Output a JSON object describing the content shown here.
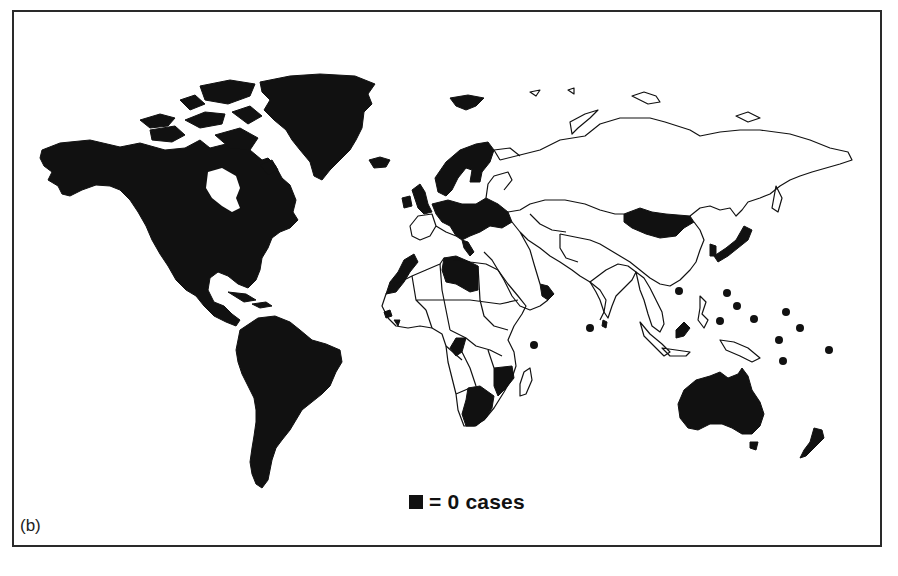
{
  "figure": {
    "panel_label": "(b)",
    "legend": {
      "swatch_color": "#111111",
      "label": "= 0 cases"
    }
  },
  "map": {
    "projection": "world outline",
    "fill_zero_cases": "#111111",
    "fill_other": "#ffffff",
    "border_color": "#111111",
    "zero_case_regions": [
      "North America (Canada, USA, Mexico)",
      "Greenland",
      "Iceland",
      "Central America",
      "Caribbean islands",
      "South America",
      "United Kingdom",
      "Ireland",
      "Scandinavia",
      "Western/Central Europe",
      "Libya",
      "Morocco/Western Sahara coast",
      "Angola (partial)",
      "Mozambique",
      "South Africa region",
      "Oman/Yemen coast",
      "Mongolia",
      "Japan",
      "South Korea",
      "Sri Lanka",
      "Malaysia (Borneo part)",
      "Australia",
      "Tasmania",
      "New Zealand"
    ],
    "island_markers": [
      {
        "x": 534,
        "y": 345
      },
      {
        "x": 590,
        "y": 328
      },
      {
        "x": 679,
        "y": 291
      },
      {
        "x": 727,
        "y": 293
      },
      {
        "x": 737,
        "y": 306
      },
      {
        "x": 720,
        "y": 321
      },
      {
        "x": 754,
        "y": 319
      },
      {
        "x": 786,
        "y": 312
      },
      {
        "x": 800,
        "y": 328
      },
      {
        "x": 779,
        "y": 340
      },
      {
        "x": 783,
        "y": 361
      },
      {
        "x": 829,
        "y": 350
      }
    ]
  }
}
